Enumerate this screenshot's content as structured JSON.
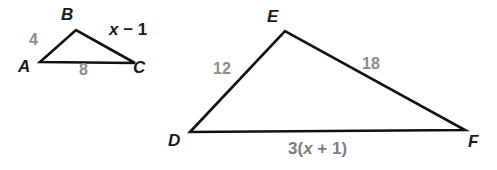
{
  "figure": {
    "type": "similar-triangles-diagram",
    "background_color": "#ffffff",
    "stroke_color": "#111111",
    "measure_color": "#8c8c8c",
    "vertex_color": "#1a1a1a"
  },
  "triangles": [
    {
      "name": "triangle-abc",
      "vertices": [
        {
          "label": "A",
          "x": 40,
          "y": 62
        },
        {
          "label": "B",
          "x": 76,
          "y": 30
        },
        {
          "label": "C",
          "x": 135,
          "y": 63
        }
      ],
      "vertex_labels": {
        "a": "A",
        "b": "B",
        "c": "C"
      },
      "sides": {
        "ab": "4",
        "bc": "x − 1",
        "ac": "8"
      }
    },
    {
      "name": "triangle-def",
      "vertices": [
        {
          "label": "D",
          "x": 190,
          "y": 132
        },
        {
          "label": "E",
          "x": 285,
          "y": 31
        },
        {
          "label": "F",
          "x": 465,
          "y": 130
        }
      ],
      "vertex_labels": {
        "d": "D",
        "e": "E",
        "f": "F"
      },
      "sides": {
        "de": "12",
        "ef": "18",
        "df": "3(x + 1)"
      }
    }
  ],
  "labels": {
    "abc_side_ab": "4",
    "abc_side_ac": "8",
    "abc_side_bc_x": "x",
    "abc_side_bc_rest": "− 1",
    "def_side_de": "12",
    "def_side_ef": "18",
    "def_side_df_pre": "3(",
    "def_side_df_x": "x",
    "def_side_df_post": "+ 1)",
    "vertex_a": "A",
    "vertex_b": "B",
    "vertex_c": "C",
    "vertex_d": "D",
    "vertex_e": "E",
    "vertex_f": "F"
  }
}
